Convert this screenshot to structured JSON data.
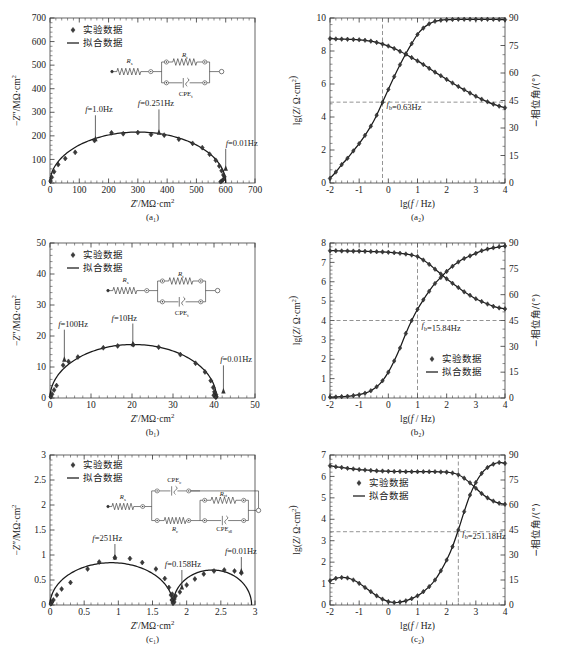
{
  "figure": {
    "marker_legend": "实验数据",
    "line_legend": "拟合数据",
    "captions": {
      "a1": "(a₁)",
      "a2": "(a₂)",
      "b1": "(b₁)",
      "b2": "(b₂)",
      "c1": "(c₁)",
      "c2": "(c₂)"
    },
    "axis_titles": {
      "nyquist_x": "Z′/MΩ·cm²",
      "nyquist_y": "−Z″/MΩ·cm²",
      "bode_x": "lg(f / Hz)",
      "bode_y_left": "lg(Z/ Ω·cm²)",
      "bode_y_right": "−相位角/(°)"
    },
    "circuit_labels": {
      "rs": "Rs",
      "rt": "Rt",
      "cpet": "CPEt",
      "rc": "Rc",
      "rct": "Rct",
      "cpec": "CPEc",
      "cpedl": "CPEdl"
    }
  },
  "chart_data": [
    {
      "id": "a1",
      "type": "scatter",
      "title": "(a₁)",
      "xlabel": "Z′/MΩ·cm²",
      "ylabel": "−Z″/MΩ·cm²",
      "xlim": [
        0,
        700
      ],
      "ylim": [
        0,
        700
      ],
      "xticks": [
        0,
        100,
        200,
        300,
        400,
        500,
        600,
        700
      ],
      "yticks": [
        0,
        100,
        200,
        300,
        400,
        500,
        600,
        700
      ],
      "grid": false,
      "legend": [
        "实验数据",
        "拟合数据"
      ],
      "annotations": [
        {
          "text": "f=1.0Hz",
          "x": 155,
          "y": 185
        },
        {
          "text": "f=0.251Hz",
          "x": 375,
          "y": 212
        },
        {
          "text": "f=0.01Hz",
          "x": 598,
          "y": 60
        }
      ],
      "series": [
        {
          "name": "实验数据",
          "x": [
            2,
            6,
            14,
            28,
            52,
            86,
            152,
            210,
            250,
            300,
            345,
            390,
            440,
            487,
            520,
            545,
            566,
            578,
            586,
            592
          ],
          "y": [
            8,
            24,
            48,
            78,
            104,
            130,
            180,
            213,
            209,
            214,
            206,
            203,
            186,
            168,
            150,
            122,
            96,
            72,
            52,
            34
          ]
        }
      ],
      "fit_semicircle": {
        "center_x": 300,
        "radius": 300,
        "flatten": 0.72
      }
    },
    {
      "id": "a2",
      "type": "line",
      "title": "(a₂)",
      "xlabel": "lg(f / Hz)",
      "ylabel_left": "lg(Z/ Ω·cm²)",
      "ylabel_right": "−相位角/(°)",
      "xlim": [
        -2,
        4
      ],
      "ylim_left": [
        0,
        10
      ],
      "ylim_right": [
        0,
        90
      ],
      "xticks": [
        -2,
        -1,
        0,
        1,
        2,
        3,
        4
      ],
      "yticks_left": [
        0,
        2,
        4,
        6,
        8,
        10
      ],
      "yticks_right": [
        0,
        15,
        30,
        45,
        60,
        75,
        90
      ],
      "legend": [
        "实验数据",
        "拟合数据"
      ],
      "annotations": [
        {
          "text": "fb=0.63Hz",
          "x": -0.2,
          "y": 4.6
        }
      ],
      "breakpoint_x": -0.2,
      "breakpoint_y_left": 4.9,
      "series": [
        {
          "name": "lgZ",
          "axis": "left",
          "x": [
            -2,
            -1.8,
            -1.6,
            -1.4,
            -1.2,
            -1,
            -0.8,
            -0.6,
            -0.4,
            -0.2,
            0,
            0.2,
            0.4,
            0.6,
            0.8,
            1,
            1.2,
            1.4,
            1.6,
            1.8,
            2,
            2.2,
            2.4,
            2.6,
            2.8,
            3,
            3.2,
            3.4,
            3.6,
            3.8,
            4
          ],
          "y": [
            8.75,
            8.73,
            8.72,
            8.71,
            8.7,
            8.68,
            8.65,
            8.6,
            8.52,
            8.42,
            8.3,
            8.15,
            7.98,
            7.8,
            7.6,
            7.4,
            7.18,
            6.95,
            6.72,
            6.5,
            6.28,
            6.06,
            5.85,
            5.65,
            5.45,
            5.26,
            5.08,
            4.92,
            4.78,
            4.66,
            4.56
          ]
        },
        {
          "name": "phase",
          "axis": "right",
          "x": [
            -2,
            -1.8,
            -1.6,
            -1.4,
            -1.2,
            -1,
            -0.8,
            -0.6,
            -0.4,
            -0.2,
            0,
            0.2,
            0.4,
            0.6,
            0.8,
            1,
            1.2,
            1.4,
            1.6,
            1.8,
            2,
            2.2,
            2.4,
            2.6,
            2.8,
            3,
            3.2,
            3.4,
            3.6,
            3.8,
            4
          ],
          "y": [
            2.5,
            6,
            10,
            13.5,
            17.5,
            21.5,
            26,
            31,
            37,
            44,
            51,
            58,
            64.5,
            70.5,
            76,
            81,
            84.5,
            86.8,
            88.2,
            88.8,
            89.1,
            89.2,
            89.3,
            89.3,
            89.3,
            89.3,
            89.3,
            89.3,
            89.3,
            89.2,
            89.1
          ]
        }
      ]
    },
    {
      "id": "b1",
      "type": "scatter",
      "title": "(b₁)",
      "xlabel": "Z′/MΩ·cm²",
      "ylabel": "−Z″/MΩ·cm²",
      "xlim": [
        0,
        50
      ],
      "ylim": [
        0,
        50
      ],
      "xticks": [
        0,
        10,
        20,
        30,
        40,
        50
      ],
      "yticks": [
        0,
        10,
        20,
        30,
        40,
        50
      ],
      "legend": [
        "实验数据",
        "拟合数据"
      ],
      "annotations": [
        {
          "text": "f=100Hz",
          "x": 3.5,
          "y": 11
        },
        {
          "text": "f=10Hz",
          "x": 20,
          "y": 17.2
        },
        {
          "text": "f=0.01Hz",
          "x": 41.5,
          "y": 2
        }
      ],
      "series": [
        {
          "name": "实验数据",
          "x": [
            0.2,
            0.5,
            1,
            1.6,
            3.2,
            4.5,
            6.8,
            13,
            16.5,
            20.3,
            26.5,
            31.8,
            35.5,
            37.8,
            39.2,
            39.8,
            40.1,
            40.3,
            40.4,
            40.5
          ],
          "y": [
            0.4,
            1.2,
            2.6,
            4,
            10.6,
            11.8,
            13.2,
            16.2,
            16.8,
            17.2,
            16.4,
            14,
            11.2,
            8.4,
            5.6,
            3.4,
            2,
            1.1,
            0.6,
            0.3
          ]
        }
      ],
      "fit_semicircle": {
        "center_x": 20.3,
        "radius": 20.3,
        "flatten": 0.85
      }
    },
    {
      "id": "b2",
      "type": "line",
      "title": "(b₂)",
      "xlabel": "lg(f / Hz)",
      "ylabel_left": "lg(Z/ Ω·cm²)",
      "ylabel_right": "−相位角/(°)",
      "xlim": [
        -2,
        4
      ],
      "ylim_left": [
        0,
        8
      ],
      "ylim_right": [
        0,
        90
      ],
      "xticks": [
        -2,
        -1,
        0,
        1,
        2,
        3,
        4
      ],
      "yticks_left": [
        0,
        1,
        2,
        3,
        4,
        5,
        6,
        7,
        8
      ],
      "yticks_right": [
        0,
        15,
        30,
        45,
        60,
        75,
        90
      ],
      "legend": [
        "实验数据",
        "拟合数据"
      ],
      "annotations": [
        {
          "text": "fb=15.84Hz",
          "x": 1,
          "y": 3.6
        }
      ],
      "breakpoint_x": 1.0,
      "breakpoint_y_left": 4.0,
      "series": [
        {
          "name": "lgZ",
          "axis": "left",
          "x": [
            -2,
            -1.8,
            -1.6,
            -1.4,
            -1.2,
            -1,
            -0.8,
            -0.6,
            -0.4,
            -0.2,
            0,
            0.2,
            0.4,
            0.6,
            0.8,
            1,
            1.2,
            1.4,
            1.6,
            1.8,
            2,
            2.2,
            2.4,
            2.6,
            2.8,
            3,
            3.2,
            3.4,
            3.6,
            3.8,
            4
          ],
          "y": [
            7.6,
            7.6,
            7.59,
            7.59,
            7.58,
            7.58,
            7.57,
            7.56,
            7.55,
            7.54,
            7.52,
            7.5,
            7.47,
            7.43,
            7.38,
            7.3,
            7.12,
            6.9,
            6.65,
            6.4,
            6.15,
            5.92,
            5.7,
            5.48,
            5.3,
            5.12,
            4.98,
            4.85,
            4.73,
            4.65,
            4.6
          ]
        },
        {
          "name": "phase",
          "axis": "right",
          "x": [
            -2,
            -1.8,
            -1.6,
            -1.4,
            -1.2,
            -1,
            -0.8,
            -0.6,
            -0.4,
            -0.2,
            0,
            0.2,
            0.4,
            0.6,
            0.8,
            1,
            1.2,
            1.4,
            1.6,
            1.8,
            2,
            2.2,
            2.4,
            2.6,
            2.8,
            3,
            3.2,
            3.4,
            3.6,
            3.8,
            4
          ],
          "y": [
            0.5,
            0.6,
            0.8,
            1,
            1.4,
            1.9,
            2.8,
            4.2,
            6.5,
            10,
            15,
            21.5,
            29,
            37.5,
            45,
            51.5,
            57,
            62,
            66.5,
            70,
            73.5,
            76.5,
            79,
            81,
            82.5,
            84,
            85.5,
            86.5,
            87.2,
            87.8,
            88.2
          ]
        }
      ]
    },
    {
      "id": "c1",
      "type": "scatter",
      "title": "(c₁)",
      "xlabel": "Z′/MΩ·cm²",
      "ylabel": "−Z″/MΩ·cm²",
      "xlim": [
        0,
        3
      ],
      "ylim": [
        0,
        3
      ],
      "xticks": [
        0,
        0.5,
        1,
        1.5,
        2,
        2.5,
        3
      ],
      "yticks": [
        0,
        0.5,
        1,
        1.5,
        2,
        2.5,
        3
      ],
      "legend": [
        "实验数据",
        "拟合数据"
      ],
      "annotations": [
        {
          "text": "f=251Hz",
          "x": 0.95,
          "y": 0.96
        },
        {
          "text": "f=0.158Hz",
          "x": 1.95,
          "y": 0.33
        },
        {
          "text": "f=0.01Hz",
          "x": 2.8,
          "y": 0.64
        }
      ],
      "series": [
        {
          "name": "实验数据",
          "x": [
            0.02,
            0.05,
            0.1,
            0.17,
            0.3,
            0.55,
            0.72,
            0.95,
            1.17,
            1.35,
            1.55,
            1.68,
            1.74,
            1.77,
            1.79,
            1.8,
            1.82,
            1.9,
            2.0,
            2.12,
            2.25,
            2.4,
            2.55,
            2.7,
            2.8
          ],
          "y": [
            0.04,
            0.1,
            0.2,
            0.32,
            0.45,
            0.72,
            0.86,
            0.95,
            0.93,
            0.85,
            0.72,
            0.53,
            0.35,
            0.2,
            0.1,
            0.05,
            0.12,
            0.26,
            0.4,
            0.52,
            0.62,
            0.68,
            0.7,
            0.68,
            0.64
          ]
        }
      ],
      "fit_semicircle_1": {
        "center_x": 0.9,
        "radius": 0.9,
        "flatten": 0.94
      },
      "fit_semicircle_2": {
        "start_x": 1.8,
        "end_x": 2.95,
        "peak_y": 0.7
      }
    },
    {
      "id": "c2",
      "type": "line",
      "title": "(c₂)",
      "xlabel": "lg(f / Hz)",
      "ylabel_left": "lg(Z/ Ω·cm²)",
      "ylabel_right": "−相位角/(°)",
      "xlim": [
        -2,
        4
      ],
      "ylim_left": [
        0,
        7
      ],
      "ylim_right": [
        0,
        90
      ],
      "xticks": [
        -2,
        -1,
        0,
        1,
        2,
        3,
        4
      ],
      "yticks_left": [
        0,
        1,
        2,
        3,
        4,
        5,
        6,
        7
      ],
      "yticks_right": [
        0,
        15,
        30,
        45,
        60,
        75,
        90
      ],
      "legend": [
        "实验数据",
        "拟合数据"
      ],
      "annotations": [
        {
          "text": "fb=251.18Hz",
          "x": 2.4,
          "y": 3.2
        }
      ],
      "breakpoint_x": 2.4,
      "breakpoint_y_left": 3.42,
      "series": [
        {
          "name": "lgZ",
          "axis": "left",
          "x": [
            -2,
            -1.8,
            -1.6,
            -1.4,
            -1.2,
            -1,
            -0.8,
            -0.6,
            -0.4,
            -0.2,
            0,
            0.2,
            0.4,
            0.6,
            0.8,
            1,
            1.2,
            1.4,
            1.6,
            1.8,
            2,
            2.2,
            2.4,
            2.6,
            2.8,
            3,
            3.2,
            3.4,
            3.6,
            3.8,
            4
          ],
          "y": [
            6.5,
            6.45,
            6.42,
            6.38,
            6.35,
            6.32,
            6.3,
            6.28,
            6.26,
            6.25,
            6.24,
            6.23,
            6.23,
            6.22,
            6.22,
            6.22,
            6.22,
            6.22,
            6.22,
            6.21,
            6.2,
            6.16,
            6.08,
            5.92,
            5.7,
            5.45,
            5.2,
            5.0,
            4.85,
            4.75,
            4.7
          ]
        },
        {
          "name": "phase",
          "axis": "right",
          "x": [
            -2,
            -1.8,
            -1.6,
            -1.4,
            -1.2,
            -1,
            -0.8,
            -0.6,
            -0.4,
            -0.2,
            0,
            0.2,
            0.4,
            0.6,
            0.8,
            1,
            1.2,
            1.4,
            1.6,
            1.8,
            2,
            2.2,
            2.4,
            2.6,
            2.8,
            3,
            3.2,
            3.4,
            3.6,
            3.8,
            4
          ],
          "y": [
            14.5,
            16,
            16.5,
            16.2,
            15,
            13,
            10.5,
            8,
            5.5,
            3.5,
            2,
            1.5,
            1.8,
            2.5,
            3.8,
            5.5,
            8,
            11,
            15,
            20.5,
            27,
            35,
            45,
            56,
            66,
            73.5,
            79,
            82.5,
            84.5,
            85.5,
            85
          ]
        }
      ]
    }
  ]
}
